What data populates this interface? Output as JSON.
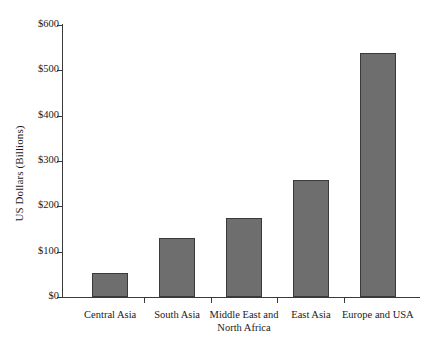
{
  "chart_data": {
    "type": "bar",
    "title": "",
    "subtitle": "",
    "xlabel": "",
    "ylabel": "US Dollars (Billions)",
    "categories": [
      "Central Asia",
      "South Asia",
      "Middle East and\nNorth Africa",
      "East Asia",
      "Europe and USA"
    ],
    "values": [
      53,
      130,
      175,
      258,
      539
    ],
    "ylim": [
      0,
      600
    ],
    "ytick_values": [
      0,
      100,
      200,
      300,
      400,
      500,
      600
    ],
    "ytick_labels": [
      "$0",
      "$100",
      "$200",
      "$300",
      "$400",
      "$500",
      "$600"
    ],
    "grid": false,
    "legend": false,
    "legend_position": "none",
    "bar_color": "#6e6e6e",
    "bar_edge_color": "#3a3a3a",
    "axis_color": "#3a3a3a",
    "background_color": "#ffffff"
  }
}
